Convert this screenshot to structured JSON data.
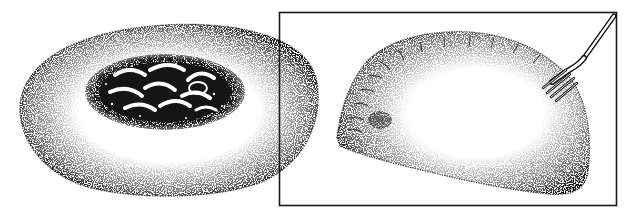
{
  "illustration": {
    "title": "Stippled pen-and-ink illustration of two pastries",
    "style": "black-and-white stipple",
    "colors": {
      "ink": "#111111",
      "paper": "#ffffff",
      "frame": "#1a1a1a"
    },
    "panels": [
      {
        "id": "open-pastry",
        "subject": "round flat pastry with braided filling in the center",
        "framed": false
      },
      {
        "id": "turnover",
        "subject": "half-moon turnover with crimped edge",
        "framed": true,
        "accessory": "fork-icon"
      }
    ]
  }
}
